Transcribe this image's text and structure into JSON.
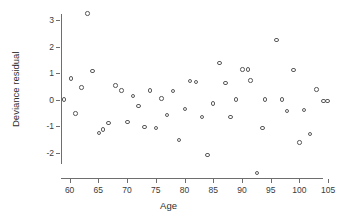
{
  "chart_data": {
    "type": "scatter",
    "title": "",
    "xlabel": "Age",
    "ylabel": "Deviance residual",
    "xlim": [
      58.5,
      105.5
    ],
    "ylim": [
      -2.95,
      3.45
    ],
    "grid": false,
    "legend": "none",
    "xticks": [
      60,
      65,
      70,
      75,
      80,
      85,
      90,
      95,
      100,
      105
    ],
    "yticks": [
      -2,
      -1,
      0,
      1,
      2,
      3
    ],
    "xtick_labels": [
      "60",
      "65",
      "70",
      "75",
      "80",
      "85",
      "90",
      "95",
      "100",
      "105"
    ],
    "ytick_labels": [
      "-2",
      "-1",
      "0",
      "1",
      "2",
      "3"
    ],
    "marker": "open-circle",
    "marker_color": "#5a5a5a",
    "points": [
      {
        "x": 59.0,
        "y": 0.0
      },
      {
        "x": 60.2,
        "y": 0.79
      },
      {
        "x": 61.0,
        "y": -0.52
      },
      {
        "x": 62.1,
        "y": 0.46
      },
      {
        "x": 63.1,
        "y": 3.25
      },
      {
        "x": 64.0,
        "y": 1.08
      },
      {
        "x": 65.1,
        "y": -1.25
      },
      {
        "x": 65.8,
        "y": -1.13
      },
      {
        "x": 66.8,
        "y": -0.88
      },
      {
        "x": 68.0,
        "y": 0.53
      },
      {
        "x": 69.0,
        "y": 0.35
      },
      {
        "x": 70.1,
        "y": -0.84
      },
      {
        "x": 71.0,
        "y": 0.14
      },
      {
        "x": 72.0,
        "y": -0.23
      },
      {
        "x": 73.0,
        "y": -1.03
      },
      {
        "x": 74.0,
        "y": 0.35
      },
      {
        "x": 75.0,
        "y": -1.06
      },
      {
        "x": 76.0,
        "y": 0.05
      },
      {
        "x": 77.0,
        "y": -0.58
      },
      {
        "x": 78.0,
        "y": 0.33
      },
      {
        "x": 79.0,
        "y": -1.52
      },
      {
        "x": 80.1,
        "y": -0.36
      },
      {
        "x": 81.0,
        "y": 0.7
      },
      {
        "x": 82.0,
        "y": 0.67
      },
      {
        "x": 83.0,
        "y": -0.66
      },
      {
        "x": 84.0,
        "y": -2.08
      },
      {
        "x": 85.0,
        "y": -0.15
      },
      {
        "x": 86.1,
        "y": 1.37
      },
      {
        "x": 87.1,
        "y": 0.62
      },
      {
        "x": 88.0,
        "y": -0.66
      },
      {
        "x": 89.0,
        "y": 0.01
      },
      {
        "x": 90.1,
        "y": 1.13
      },
      {
        "x": 91.0,
        "y": 1.13
      },
      {
        "x": 91.5,
        "y": 0.72
      },
      {
        "x": 92.6,
        "y": -2.77
      },
      {
        "x": 93.6,
        "y": -1.07
      },
      {
        "x": 94.0,
        "y": 0.0
      },
      {
        "x": 96.0,
        "y": 2.25
      },
      {
        "x": 97.0,
        "y": 0.01
      },
      {
        "x": 97.8,
        "y": -0.43
      },
      {
        "x": 99.0,
        "y": 1.12
      },
      {
        "x": 100.0,
        "y": -1.62
      },
      {
        "x": 100.8,
        "y": -0.4
      },
      {
        "x": 101.8,
        "y": -1.3
      },
      {
        "x": 103.0,
        "y": 0.38
      },
      {
        "x": 104.2,
        "y": -0.06
      },
      {
        "x": 104.9,
        "y": -0.06
      }
    ]
  }
}
